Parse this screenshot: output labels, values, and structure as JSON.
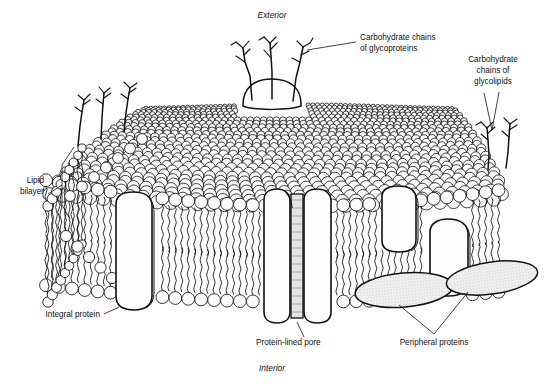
{
  "figure": {
    "background_color": "#ffffff",
    "ink_color": "#111111"
  },
  "labels": {
    "exterior": "Exterior",
    "interior": "Interior",
    "carb_glycoproteins": [
      "Carbohydrate chains",
      "of glycoproteins"
    ],
    "carb_glycolipids": [
      "Carbohydrate",
      "chains of",
      "glycolipids"
    ],
    "lipid_bilayer": [
      "Lipid",
      "bilayer"
    ],
    "integral_protein": "Integral protein",
    "protein_lined_pore": "Protein-lined pore",
    "peripheral_proteins": "Peripheral proteins"
  },
  "structures": {
    "glycoprotein_dome": "glycoprotein-dome",
    "integral_proteins_count": 4,
    "peripheral_proteins_count": 2,
    "pore_count": 1,
    "carbohydrate_chains_glycoprotein": 3,
    "carbohydrate_chains_glycolipid": 2,
    "carbohydrate_chains_left": 3
  }
}
